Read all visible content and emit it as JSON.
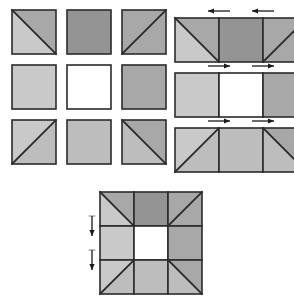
{
  "figure": {
    "canvas": {
      "width": 294,
      "height": 300
    },
    "background_color": "#ffffff"
  },
  "colors": {
    "light_gray": "#c9c9c9",
    "medium_gray": "#a8a8a8",
    "dark_gray": "#949494",
    "white": "#ffffff",
    "outline": "#2b2b2b",
    "arrow": "#1a1a1a",
    "tick": "#9a9a9a"
  },
  "panels": [
    {
      "name": "separate-units-panel",
      "label": "Separate units",
      "origin": {
        "x": 12,
        "y": 10
      },
      "unit_size": 44,
      "gap": 11,
      "rows": [
        {
          "name": "units-row-1",
          "units": [
            {
              "name": "unit-r1c1",
              "type": "half-square-triangle",
              "diagonal": "tl-br",
              "fill_a": "#c9c9c9",
              "fill_b": "#a8a8a8"
            },
            {
              "name": "unit-r1c2",
              "type": "plain-square",
              "fill": "#949494"
            },
            {
              "name": "unit-r1c3",
              "type": "half-square-triangle",
              "diagonal": "bl-tr",
              "fill_a": "#a8a8a8",
              "fill_b": "#a8a8a8"
            }
          ]
        },
        {
          "name": "units-row-2",
          "units": [
            {
              "name": "unit-r2c1",
              "type": "plain-square",
              "fill": "#c9c9c9"
            },
            {
              "name": "unit-r2c2",
              "type": "plain-square",
              "fill": "#ffffff"
            },
            {
              "name": "unit-r2c3",
              "type": "plain-square",
              "fill": "#a8a8a8"
            }
          ]
        },
        {
          "name": "units-row-3",
          "units": [
            {
              "name": "unit-r3c1",
              "type": "half-square-triangle",
              "diagonal": "bl-tr",
              "fill_a": "#c9c9c9",
              "fill_b": "#bdbdbd"
            },
            {
              "name": "unit-r3c2",
              "type": "plain-square",
              "fill": "#bdbdbd"
            },
            {
              "name": "unit-r3c3",
              "type": "half-square-triangle",
              "diagonal": "tl-br",
              "fill_a": "#bdbdbd",
              "fill_b": "#a8a8a8"
            }
          ]
        }
      ]
    },
    {
      "name": "joined-rows-panel",
      "label": "Rows sewn together",
      "origin": {
        "x": 175,
        "y": 18
      },
      "unit_size": 44,
      "row_gap": 11,
      "rows": [
        {
          "name": "joined-row-1",
          "arrow_direction": "left",
          "arrow_count": 2,
          "units": [
            {
              "name": "joined-r1c1",
              "type": "half-square-triangle",
              "diagonal": "tl-br",
              "fill_a": "#c9c9c9",
              "fill_b": "#a8a8a8"
            },
            {
              "name": "joined-r1c2",
              "type": "plain-square",
              "fill": "#949494"
            },
            {
              "name": "joined-r1c3",
              "type": "half-square-triangle",
              "diagonal": "bl-tr",
              "fill_a": "#a8a8a8",
              "fill_b": "#a8a8a8"
            }
          ]
        },
        {
          "name": "joined-row-2",
          "arrow_direction": "right",
          "arrow_count": 2,
          "units": [
            {
              "name": "joined-r2c1",
              "type": "plain-square",
              "fill": "#c9c9c9"
            },
            {
              "name": "joined-r2c2",
              "type": "plain-square",
              "fill": "#ffffff"
            },
            {
              "name": "joined-r2c3",
              "type": "plain-square",
              "fill": "#a8a8a8"
            }
          ]
        },
        {
          "name": "joined-row-3",
          "arrow_direction": "right",
          "arrow_count": 2,
          "units": [
            {
              "name": "joined-r3c1",
              "type": "half-square-triangle",
              "diagonal": "bl-tr",
              "fill_a": "#c9c9c9",
              "fill_b": "#bdbdbd"
            },
            {
              "name": "joined-r3c2",
              "type": "plain-square",
              "fill": "#bdbdbd"
            },
            {
              "name": "joined-r3c3",
              "type": "half-square-triangle",
              "diagonal": "tl-br",
              "fill_a": "#bdbdbd",
              "fill_b": "#a8a8a8"
            }
          ]
        }
      ]
    },
    {
      "name": "finished-block-panel",
      "label": "Finished block",
      "origin": {
        "x": 100,
        "y": 192
      },
      "unit_size": 34,
      "arrow_direction": "down",
      "arrow_count": 2,
      "rows": [
        {
          "name": "block-row-1",
          "units": [
            {
              "name": "block-r1c1",
              "type": "half-square-triangle",
              "diagonal": "tl-br",
              "fill_a": "#c9c9c9",
              "fill_b": "#a8a8a8"
            },
            {
              "name": "block-r1c2",
              "type": "plain-square",
              "fill": "#949494"
            },
            {
              "name": "block-r1c3",
              "type": "half-square-triangle",
              "diagonal": "bl-tr",
              "fill_a": "#a8a8a8",
              "fill_b": "#a8a8a8"
            }
          ]
        },
        {
          "name": "block-row-2",
          "units": [
            {
              "name": "block-r2c1",
              "type": "plain-square",
              "fill": "#c9c9c9"
            },
            {
              "name": "block-r2c2",
              "type": "plain-square",
              "fill": "#ffffff"
            },
            {
              "name": "block-r2c3",
              "type": "plain-square",
              "fill": "#a8a8a8"
            }
          ]
        },
        {
          "name": "block-row-3",
          "units": [
            {
              "name": "block-r3c1",
              "type": "half-square-triangle",
              "diagonal": "bl-tr",
              "fill_a": "#c9c9c9",
              "fill_b": "#bdbdbd"
            },
            {
              "name": "block-r3c2",
              "type": "plain-square",
              "fill": "#bdbdbd"
            },
            {
              "name": "block-r3c3",
              "type": "half-square-triangle",
              "diagonal": "tl-br",
              "fill_a": "#bdbdbd",
              "fill_b": "#a8a8a8"
            }
          ]
        }
      ]
    }
  ]
}
